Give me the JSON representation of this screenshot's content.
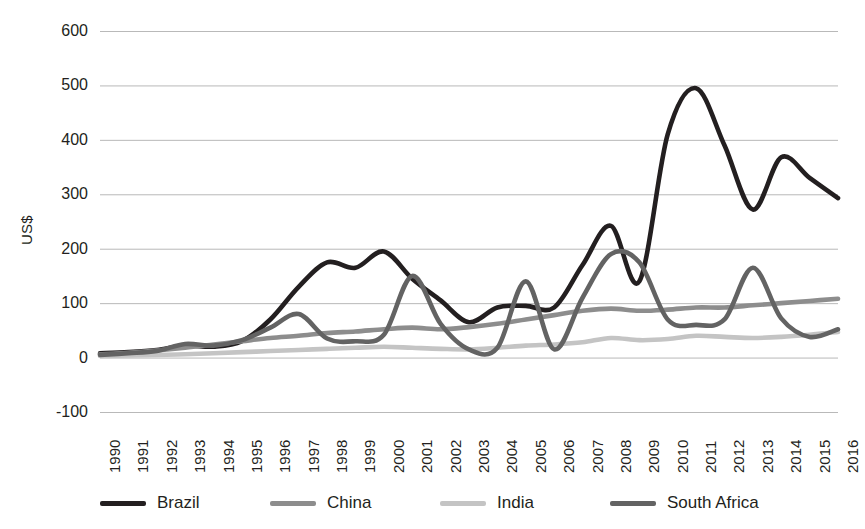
{
  "chart_data": {
    "type": "line",
    "title": "",
    "xlabel": "",
    "ylabel": "US$",
    "ylim": [
      -100,
      600
    ],
    "ytick_step": 100,
    "yticks": [
      600,
      500,
      400,
      300,
      200,
      100,
      0,
      -100
    ],
    "grid": true,
    "legend_position": "bottom",
    "categories": [
      "1990",
      "1991",
      "1992",
      "1993",
      "1994",
      "1995",
      "1996",
      "1997",
      "1998",
      "1999",
      "2000",
      "2001",
      "2002",
      "2003",
      "2004",
      "2005",
      "2006",
      "2007",
      "2008",
      "2009",
      "2010",
      "2011",
      "2012",
      "2013",
      "2014",
      "2015",
      "2016"
    ],
    "series": [
      {
        "name": "Brazil",
        "color": "#231f20",
        "width": 4.6,
        "values": [
          8,
          10,
          14,
          22,
          20,
          30,
          70,
          130,
          175,
          165,
          195,
          145,
          105,
          65,
          92,
          95,
          92,
          170,
          242,
          140,
          410,
          495,
          390,
          272,
          368,
          330,
          293
        ]
      },
      {
        "name": "China",
        "color": "#8d8d8d",
        "width": 4.6,
        "values": [
          6,
          9,
          13,
          18,
          24,
          30,
          36,
          40,
          45,
          48,
          52,
          55,
          52,
          56,
          62,
          70,
          78,
          86,
          90,
          86,
          88,
          92,
          92,
          96,
          100,
          104,
          108
        ]
      },
      {
        "name": "India",
        "color": "#c4c4c4",
        "width": 4.6,
        "values": [
          3,
          4,
          5,
          6,
          8,
          10,
          12,
          14,
          16,
          18,
          20,
          18,
          16,
          15,
          18,
          22,
          24,
          28,
          36,
          32,
          34,
          40,
          38,
          36,
          38,
          42,
          47
        ]
      },
      {
        "name": "South Africa",
        "color": "#636363",
        "width": 4.6,
        "values": [
          5,
          8,
          12,
          25,
          22,
          32,
          55,
          80,
          35,
          30,
          42,
          150,
          62,
          15,
          18,
          140,
          15,
          110,
          190,
          175,
          70,
          60,
          70,
          165,
          72,
          38,
          52
        ]
      }
    ]
  },
  "legend": {
    "items": [
      {
        "label": "Brazil"
      },
      {
        "label": "China"
      },
      {
        "label": "India"
      },
      {
        "label": "South Africa"
      }
    ]
  }
}
